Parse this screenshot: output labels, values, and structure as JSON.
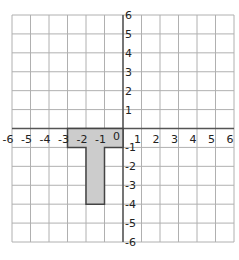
{
  "grid": {
    "xmin": -6,
    "xmax": 6,
    "ymin": -6,
    "ymax": 6,
    "step": 1
  },
  "x_ticks": [
    "-6",
    "-5",
    "-4",
    "-3",
    "-2",
    "-1",
    "0",
    "1",
    "2",
    "3",
    "4",
    "5",
    "6"
  ],
  "y_ticks": [
    "6",
    "5",
    "4",
    "3",
    "2",
    "1",
    "-1",
    "-2",
    "-3",
    "-4",
    "-5",
    "-6"
  ],
  "origin_label": "0",
  "shape": {
    "name": "T-shape",
    "fill": "#cccccc",
    "stroke": "#444444",
    "points": [
      [
        -3,
        0
      ],
      [
        0,
        0
      ],
      [
        0,
        -1
      ],
      [
        -1,
        -1
      ],
      [
        -1,
        -4
      ],
      [
        -2,
        -4
      ],
      [
        -2,
        -1
      ],
      [
        -3,
        -1
      ]
    ]
  },
  "colors": {
    "grid": "#b0b0b0",
    "axis": "#555555"
  }
}
